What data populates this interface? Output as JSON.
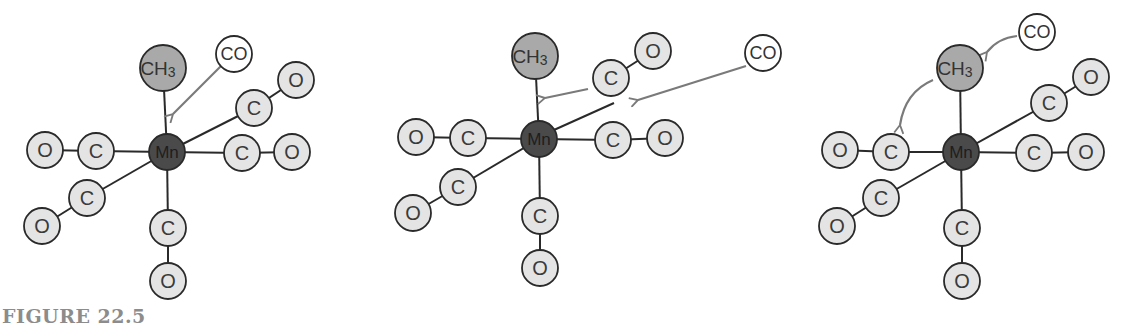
{
  "figure": {
    "caption": "FIGURE 22.5",
    "colors": {
      "metal_fill": "#4a4a4a",
      "methyl_fill": "#a9a9a9",
      "ligand_fill": "#e4e4e4",
      "free_co_fill": "#ffffff",
      "arrow": "#7a7a7a",
      "bond": "#2a2a2a",
      "caption": "#8c8c8c"
    },
    "labels": {
      "metal": "Mn",
      "methyl": "CH",
      "methyl_sub": "3",
      "carbon": "C",
      "oxygen": "O",
      "carbonyl": "CO"
    },
    "panels": [
      {
        "id": "panel-1",
        "description": "CO approaches Mn(CO)5CH3; arrow points to Mn-CH3 bond",
        "metal": {
          "x": 167,
          "y": 152
        },
        "methyl": {
          "x": 163,
          "y": 68
        },
        "free_co": {
          "x": 234,
          "y": 54
        }
      },
      {
        "id": "panel-2",
        "description": "CO ligand migrates to CH3 (arrow), free CO approaches vacated site",
        "metal": {
          "x": 539,
          "y": 139
        },
        "methyl": {
          "x": 535,
          "y": 56
        },
        "free_co": {
          "x": 763,
          "y": 53
        }
      },
      {
        "id": "panel-3",
        "description": "Alternative: CH3 migrates to adjacent CO; free CO attacks",
        "metal": {
          "x": 961,
          "y": 152
        },
        "methyl": {
          "x": 960,
          "y": 68
        },
        "free_co": {
          "x": 1037,
          "y": 32
        }
      }
    ]
  }
}
